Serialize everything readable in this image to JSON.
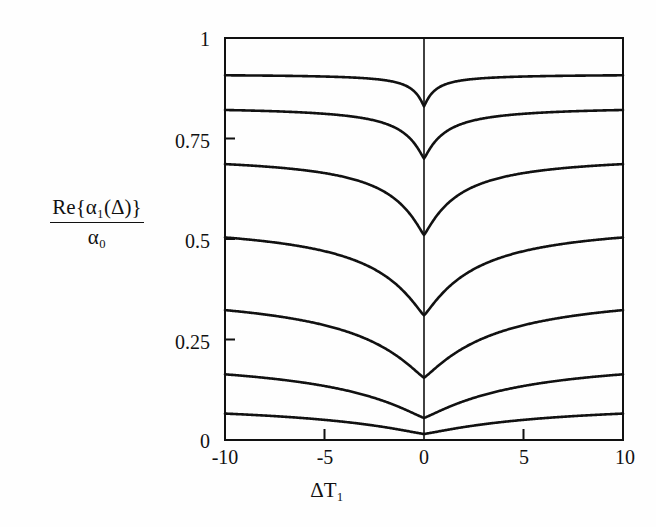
{
  "figure": {
    "background_color": "#fefefe",
    "line_color": "#111111",
    "axis_color": "#111111"
  },
  "axes": {
    "y_label_numerator": "Re{α₁(Δ)}",
    "y_label_denominator": "α₀",
    "x_label": "ΔT₁",
    "x_ticks": [
      "-10",
      "-5",
      "0",
      "5",
      "10"
    ],
    "y_ticks": [
      "0",
      "0.25",
      "0.5",
      "0.75",
      "1"
    ]
  },
  "chart_data": {
    "type": "line",
    "title": "",
    "xlabel": "ΔT₁",
    "ylabel": "Re{α₁(Δ)}/α₀",
    "xlim": [
      -10,
      10
    ],
    "ylim": [
      0,
      1
    ],
    "xticks": [
      -10,
      -5,
      0,
      5,
      10
    ],
    "yticks": [
      0,
      0.25,
      0.5,
      0.75,
      1
    ],
    "grid": false,
    "legend": "none",
    "annotations": [
      "vertical reference line drawn at ΔT₁ = 0"
    ],
    "x": [
      -10,
      -9,
      -8,
      -7,
      -6,
      -5,
      -4,
      -3,
      -2.5,
      -2,
      -1.5,
      -1,
      -0.75,
      -0.5,
      -0.25,
      0,
      0.25,
      0.5,
      0.75,
      1,
      1.5,
      2,
      2.5,
      3,
      4,
      5,
      6,
      7,
      8,
      9,
      10
    ],
    "series": [
      {
        "name": "curve-1",
        "plateau": 0.91,
        "minimum": 0.83,
        "half_width": 0.55,
        "values": [
          0.91,
          0.91,
          0.91,
          0.909,
          0.909,
          0.908,
          0.907,
          0.904,
          0.902,
          0.898,
          0.891,
          0.879,
          0.87,
          0.86,
          0.845,
          0.83,
          0.845,
          0.86,
          0.87,
          0.879,
          0.891,
          0.898,
          0.902,
          0.904,
          0.907,
          0.908,
          0.909,
          0.909,
          0.91,
          0.91,
          0.91
        ]
      },
      {
        "name": "curve-2",
        "plateau": 0.83,
        "minimum": 0.7,
        "half_width": 1.05,
        "values": [
          0.829,
          0.829,
          0.828,
          0.827,
          0.826,
          0.824,
          0.82,
          0.812,
          0.806,
          0.797,
          0.784,
          0.765,
          0.752,
          0.739,
          0.722,
          0.7,
          0.722,
          0.739,
          0.752,
          0.765,
          0.784,
          0.797,
          0.806,
          0.812,
          0.82,
          0.824,
          0.826,
          0.827,
          0.828,
          0.829,
          0.829
        ]
      },
      {
        "name": "curve-3",
        "plateau": 0.71,
        "minimum": 0.51,
        "half_width": 1.75,
        "values": [
          0.708,
          0.707,
          0.706,
          0.704,
          0.701,
          0.697,
          0.69,
          0.676,
          0.665,
          0.65,
          0.629,
          0.6,
          0.583,
          0.565,
          0.541,
          0.51,
          0.541,
          0.565,
          0.583,
          0.6,
          0.629,
          0.65,
          0.665,
          0.676,
          0.69,
          0.697,
          0.701,
          0.704,
          0.706,
          0.707,
          0.708
        ]
      },
      {
        "name": "curve-4",
        "plateau": 0.545,
        "minimum": 0.31,
        "half_width": 2.6,
        "values": [
          0.541,
          0.539,
          0.537,
          0.533,
          0.528,
          0.52,
          0.508,
          0.488,
          0.474,
          0.456,
          0.432,
          0.402,
          0.385,
          0.367,
          0.343,
          0.31,
          0.343,
          0.367,
          0.385,
          0.402,
          0.432,
          0.456,
          0.474,
          0.488,
          0.508,
          0.52,
          0.528,
          0.533,
          0.537,
          0.539,
          0.541
        ]
      },
      {
        "name": "curve-5",
        "plateau": 0.375,
        "minimum": 0.155,
        "half_width": 3.6,
        "values": [
          0.37,
          0.367,
          0.363,
          0.358,
          0.351,
          0.341,
          0.326,
          0.305,
          0.291,
          0.274,
          0.253,
          0.228,
          0.214,
          0.2,
          0.181,
          0.155,
          0.181,
          0.2,
          0.214,
          0.228,
          0.253,
          0.274,
          0.291,
          0.305,
          0.326,
          0.341,
          0.351,
          0.358,
          0.363,
          0.367,
          0.37
        ]
      },
      {
        "name": "curve-6",
        "plateau": 0.21,
        "minimum": 0.055,
        "half_width": 4.8,
        "values": [
          0.205,
          0.202,
          0.198,
          0.193,
          0.186,
          0.177,
          0.164,
          0.147,
          0.136,
          0.124,
          0.11,
          0.093,
          0.084,
          0.076,
          0.065,
          0.055,
          0.065,
          0.076,
          0.084,
          0.093,
          0.11,
          0.124,
          0.136,
          0.147,
          0.164,
          0.177,
          0.186,
          0.193,
          0.198,
          0.202,
          0.205
        ]
      },
      {
        "name": "curve-7",
        "plateau": 0.095,
        "minimum": 0.015,
        "half_width": 6.2,
        "values": [
          0.093,
          0.091,
          0.089,
          0.086,
          0.083,
          0.078,
          0.071,
          0.062,
          0.057,
          0.051,
          0.044,
          0.036,
          0.032,
          0.027,
          0.022,
          0.015,
          0.022,
          0.027,
          0.032,
          0.036,
          0.044,
          0.051,
          0.057,
          0.062,
          0.071,
          0.078,
          0.083,
          0.086,
          0.089,
          0.091,
          0.093
        ]
      }
    ]
  },
  "geometry": {
    "plot_left": 225,
    "plot_right": 623,
    "plot_top": 38,
    "plot_bottom": 440
  }
}
